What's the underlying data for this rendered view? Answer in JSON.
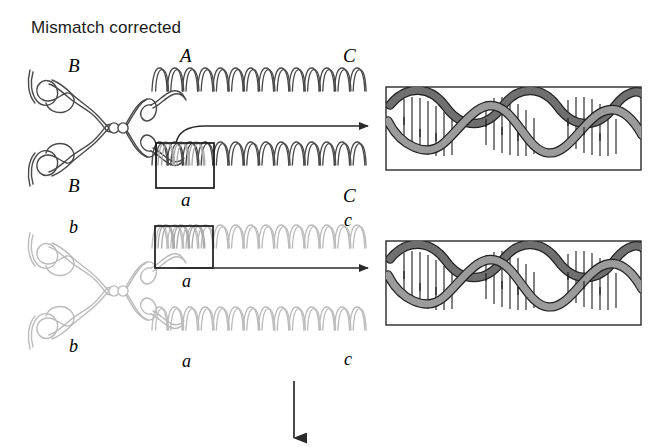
{
  "figure": {
    "title": "Mismatch corrected",
    "domain_note": "meiotic recombination / heteroduplex mismatch repair diagram",
    "background_color": "#ffffff",
    "flow_arrow": {
      "name": "downward-flow-arrow",
      "direction": "down",
      "color": "#333333"
    }
  },
  "colors": {
    "ink": "#3a3a3a",
    "ink_dark": "#222222",
    "chromatid_upper": "#4a4a4a",
    "chromatid_lower": "#b9b9b9",
    "helix_inset_fill": "#9a9a9a",
    "dna_ribbon": "#6f6f6f",
    "dna_ribbon_dark": "#4b4b4b",
    "box_stroke": "#1a1a1a",
    "label_text": "#000000",
    "title_text": "#1a1a1a"
  },
  "chromosomes": [
    {
      "id": "upper",
      "shade": "dark",
      "arm_labels_left": [
        "B",
        "B"
      ],
      "arm_labels_mid": [
        "A",
        "a"
      ],
      "arm_labels_right": [
        "C",
        "C"
      ],
      "boxed_region_label": "a",
      "boxed_on_chromatid": "lower-chromatid"
    },
    {
      "id": "lower",
      "shade": "light",
      "arm_labels_left": [
        "b",
        "b"
      ],
      "arm_labels_mid": [
        "a",
        "a"
      ],
      "arm_labels_right": [
        "c",
        "c"
      ],
      "boxed_region_label": "a",
      "boxed_on_chromatid": "upper-chromatid"
    }
  ],
  "labels": {
    "upper_left_top": "B",
    "upper_left_bottom": "B",
    "upper_mid_top": "A",
    "upper_mid_bottom": "a",
    "upper_right_top": "C",
    "upper_right_bottom": "C",
    "lower_left_top": "b",
    "lower_left_bottom": "b",
    "lower_mid_top": "a",
    "lower_mid_bottom": "a",
    "lower_right_top": "c",
    "lower_right_bottom": "c"
  },
  "insets": [
    {
      "id": "inset-upper",
      "name": "dna-double-helix-inset-upper",
      "content": "DNA double helix, base pairs matched (mismatch corrected)",
      "turns": 3,
      "border": true
    },
    {
      "id": "inset-lower",
      "name": "dna-double-helix-inset-lower",
      "content": "DNA double helix, base pairs matched (mismatch corrected)",
      "turns": 3,
      "border": true
    }
  ],
  "callouts": [
    {
      "id": "callout-upper",
      "style": "curved",
      "from": "boxed-region-upper",
      "to": "inset-upper"
    },
    {
      "id": "callout-lower",
      "style": "straight",
      "from": "boxed-region-lower",
      "to": "inset-lower"
    }
  ]
}
